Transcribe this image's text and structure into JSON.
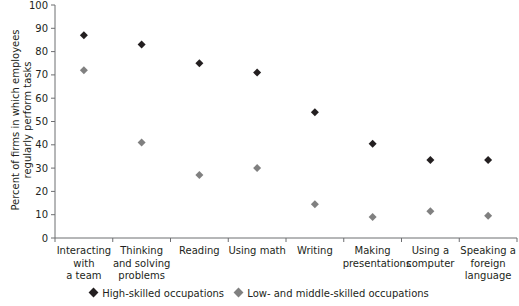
{
  "chart_data": {
    "type": "scatter",
    "title": "",
    "xlabel": "",
    "ylabel": "Percent of firms in which employees regularly perform tasks",
    "ylabel_lines": [
      "Percent of firms in which employees",
      "regularly perform tasks"
    ],
    "ylim": [
      0,
      100
    ],
    "yticks": [
      0,
      10,
      20,
      30,
      40,
      50,
      60,
      70,
      80,
      90,
      100
    ],
    "grid": false,
    "legend_position": "bottom",
    "categories": [
      "Interacting with a team",
      "Thinking and solving problems",
      "Reading",
      "Using math",
      "Writing",
      "Making presentations",
      "Using a computer",
      "Speaking a foreign language"
    ],
    "category_lines": [
      [
        "Interacting",
        "with",
        "a team"
      ],
      [
        "Thinking",
        "and solving",
        "problems"
      ],
      [
        "Reading"
      ],
      [
        "Using math"
      ],
      [
        "Writing"
      ],
      [
        "Making",
        "presentations"
      ],
      [
        "Using a",
        "computer"
      ],
      [
        "Speaking a",
        "foreign",
        "language"
      ]
    ],
    "series": [
      {
        "name": "High-skilled occupations",
        "color": "#231f20",
        "marker": "diamond",
        "values": [
          87,
          83,
          75,
          71,
          54,
          40.5,
          33.5,
          33.5
        ]
      },
      {
        "name": "Low- and middle-skilled occupations",
        "color": "#808080",
        "marker": "diamond",
        "values": [
          72,
          41,
          27,
          30,
          14.5,
          9,
          11.5,
          9.5
        ]
      }
    ]
  },
  "legend": {
    "high": "High-skilled occupations",
    "low": "Low- and middle-skilled occupations"
  }
}
